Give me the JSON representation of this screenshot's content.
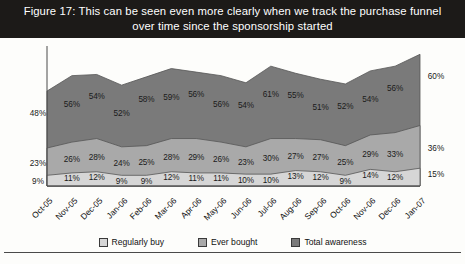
{
  "title": "Figure 17: This can be seen even more clearly when we track the purchase funnel over time since the sponsorship started",
  "legend": {
    "items": [
      {
        "label": "Regularly buy",
        "color": "#d6d6d6",
        "key": "regularly_buy"
      },
      {
        "label": "Ever bought",
        "color": "#a9a9a9",
        "key": "ever_bought"
      },
      {
        "label": "Total awareness",
        "color": "#7a7a7a",
        "key": "total_awareness"
      }
    ]
  },
  "edge_values": {
    "left": [
      "48%",
      "23%",
      "9%"
    ],
    "right": [
      "60%",
      "36%",
      "15%"
    ]
  },
  "chart_data": {
    "type": "area",
    "stacked": true,
    "title": "Figure 17: This can be seen even more clearly when we track the purchase funnel over time since the sponsorship started",
    "xlabel": "",
    "ylabel": "",
    "grid": false,
    "legend_position": "bottom",
    "ylim": [
      0,
      100
    ],
    "categories": [
      "Oct-05",
      "Nov-05",
      "Dec-05",
      "Jan-06",
      "Feb-06",
      "Mar-06",
      "Apr-06",
      "May-06",
      "Jun-06",
      "Jul-06",
      "Aug-06",
      "Sep-06",
      "Oct-06",
      "Nov-06",
      "Dec-06",
      "Jan-07"
    ],
    "series": [
      {
        "name": "Regularly buy",
        "color": "#d6d6d6",
        "values": [
          9,
          11,
          12,
          9,
          9,
          12,
          11,
          11,
          10,
          10,
          13,
          12,
          9,
          14,
          12,
          15
        ],
        "labels": [
          "9%",
          "11%",
          "12%",
          "9%",
          "9%",
          "12%",
          "11%",
          "11%",
          "10%",
          "10%",
          "13%",
          "12%",
          "9%",
          "14%",
          "12%",
          "15%"
        ]
      },
      {
        "name": "Ever bought",
        "color": "#a9a9a9",
        "values": [
          23,
          26,
          28,
          24,
          25,
          28,
          29,
          26,
          23,
          30,
          27,
          27,
          25,
          29,
          33,
          36
        ],
        "labels": [
          "23%",
          "26%",
          "28%",
          "24%",
          "25%",
          "28%",
          "29%",
          "26%",
          "23%",
          "30%",
          "27%",
          "27%",
          "25%",
          "29%",
          "33%",
          "36%"
        ]
      },
      {
        "name": "Total awareness",
        "color": "#7a7a7a",
        "values": [
          48,
          56,
          54,
          52,
          58,
          59,
          56,
          56,
          54,
          61,
          55,
          51,
          52,
          54,
          56,
          60
        ],
        "labels": [
          "48%",
          "56%",
          "54%",
          "52%",
          "58%",
          "59%",
          "56%",
          "56%",
          "54%",
          "61%",
          "55%",
          "51%",
          "52%",
          "54%",
          "56%",
          "60%"
        ]
      }
    ]
  }
}
